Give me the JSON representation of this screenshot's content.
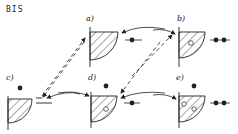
{
  "title": "BIS",
  "panels": [
    {
      "id": "a",
      "label": "a)"
    },
    {
      "id": "b",
      "label": "b)"
    },
    {
      "id": "c",
      "label": "c)"
    },
    {
      "id": "d",
      "label": "d)"
    },
    {
      "id": "e",
      "label": "e)"
    }
  ],
  "colors": {
    "ink": "#222222",
    "background": "#ffffff"
  }
}
